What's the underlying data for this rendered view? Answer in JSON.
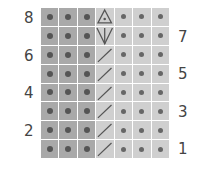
{
  "chart": {
    "title": "",
    "columns": 7,
    "rows": 8,
    "row_labels_left": [
      "8",
      "6",
      "4",
      "2"
    ],
    "row_labels_right": [
      "7",
      "5",
      "3",
      "1"
    ],
    "colors": {
      "dark_cell": "#a9a9a9",
      "light_cell": "#cfcfcf",
      "dot": "#555555",
      "symbol_stroke": "#555555"
    },
    "legend_symbols": {
      "dot": "purl",
      "slash": "right-leaning-slash",
      "triangle-dot": "increase-triangle",
      "arrow-down": "down-arrow"
    },
    "grid": [
      [
        "dot",
        "dot",
        "dot",
        "triangle-dot",
        "dot",
        "dot",
        "dot"
      ],
      [
        "dot",
        "dot",
        "dot",
        "arrow-down",
        "dot",
        "dot",
        "dot"
      ],
      [
        "dot",
        "dot",
        "dot",
        "slash",
        "dot",
        "dot",
        "dot"
      ],
      [
        "dot",
        "dot",
        "dot",
        "slash",
        "dot",
        "dot",
        "dot"
      ],
      [
        "dot",
        "dot",
        "dot",
        "slash",
        "dot",
        "dot",
        "dot"
      ],
      [
        "dot",
        "dot",
        "dot",
        "slash",
        "dot",
        "dot",
        "dot"
      ],
      [
        "dot",
        "dot",
        "dot",
        "slash",
        "dot",
        "dot",
        "dot"
      ],
      [
        "dot",
        "dot",
        "dot",
        "slash",
        "dot",
        "dot",
        "dot"
      ]
    ]
  },
  "chart_data": {
    "type": "table",
    "columns": 7,
    "rows": 8,
    "row_numbers": [
      8,
      7,
      6,
      5,
      4,
      3,
      2,
      1
    ],
    "left_labels": [
      8,
      6,
      4,
      2
    ],
    "right_labels": [
      7,
      5,
      3,
      1
    ],
    "shaded_columns": [
      1,
      2,
      3
    ],
    "symbol_column": 4,
    "symbols_top_to_bottom_col4": [
      "triangle-dot",
      "arrow-down",
      "slash",
      "slash",
      "slash",
      "slash",
      "slash",
      "slash"
    ]
  }
}
